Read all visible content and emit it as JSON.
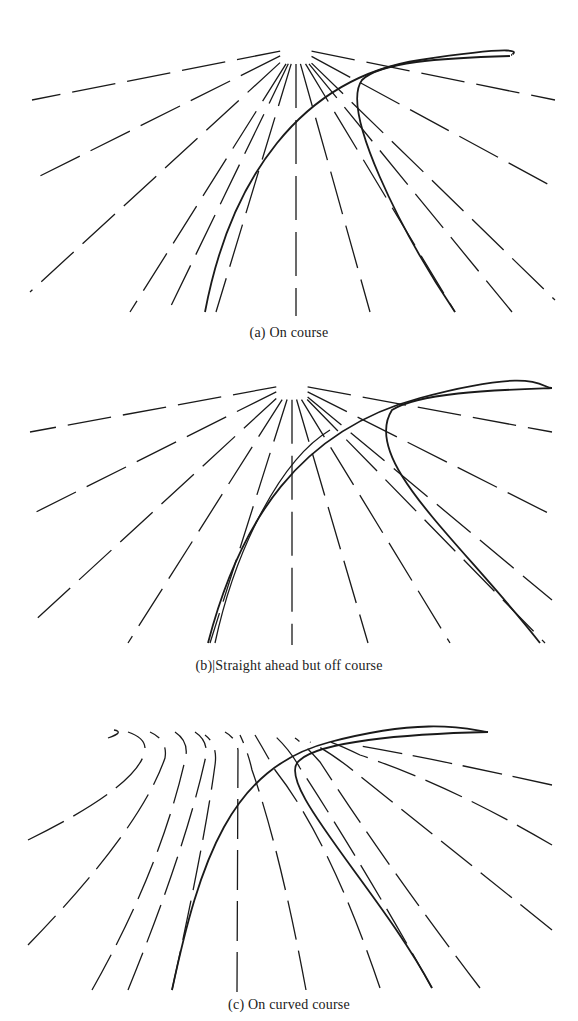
{
  "figure": {
    "panels": [
      {
        "id": "a",
        "caption": "(a) On course",
        "flow": "radial",
        "road": "curved-left-then-right-horizon",
        "ink_color": "#1a1a1a"
      },
      {
        "id": "b",
        "caption": "(b)|Straight ahead but off course",
        "flow": "radial",
        "road": "curved-offset",
        "ink_color": "#1a1a1a"
      },
      {
        "id": "c",
        "caption": "(c) On curved course",
        "flow": "curved",
        "road": "curved-left-then-right-horizon",
        "ink_color": "#1a1a1a"
      }
    ]
  }
}
